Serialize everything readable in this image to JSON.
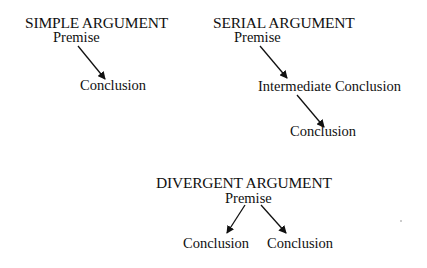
{
  "diagrams": {
    "simple": {
      "title": "SIMPLE ARGUMENT",
      "premise": "Premise",
      "conclusion": "Conclusion"
    },
    "serial": {
      "title": "SERIAL ARGUMENT",
      "premise": "Premise",
      "intermediate": "Intermediate Conclusion",
      "conclusion": "Conclusion"
    },
    "divergent": {
      "title": "DIVERGENT ARGUMENT",
      "premise": "Premise",
      "conclusion_left": "Conclusion",
      "conclusion_right": "Conclusion"
    }
  },
  "colors": {
    "text": "#111111",
    "arrow": "#111111",
    "background": "#ffffff"
  }
}
